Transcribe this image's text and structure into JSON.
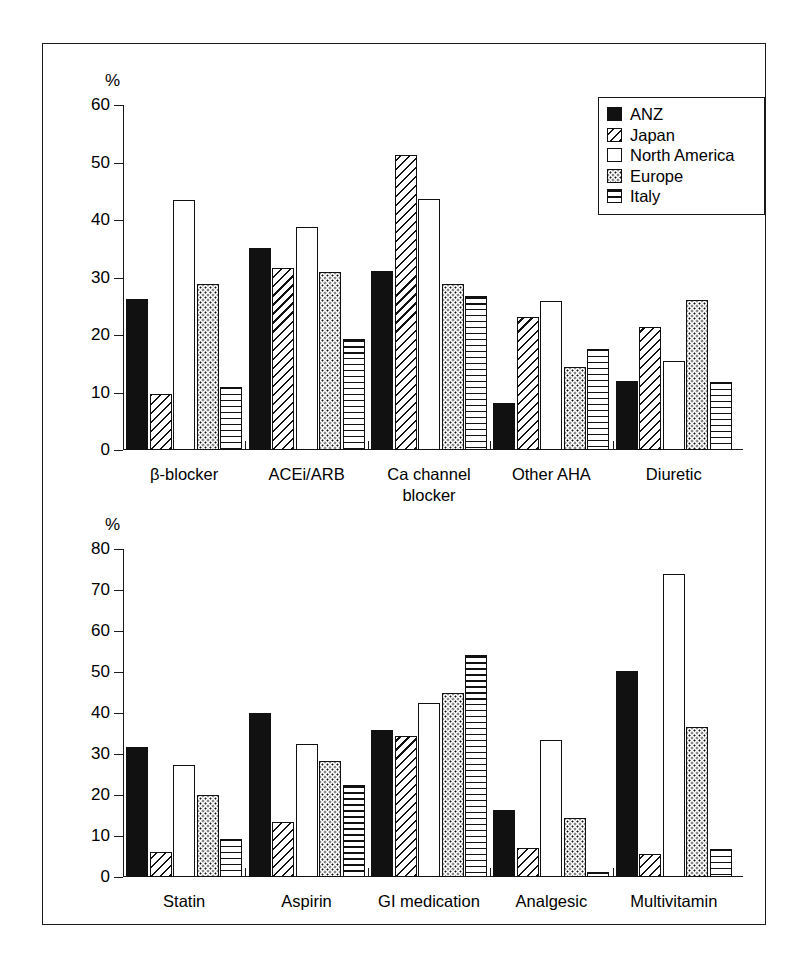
{
  "figure": {
    "axis_unit_label": "%"
  },
  "legend": {
    "position": "top-right",
    "entries": [
      {
        "label": "ANZ",
        "pattern": "solid-black",
        "key": "anz"
      },
      {
        "label": "Japan",
        "pattern": "diagonal-hatch",
        "key": "japan"
      },
      {
        "label": "North America",
        "pattern": "white-empty",
        "key": "northamerica"
      },
      {
        "label": "Europe",
        "pattern": "dotted",
        "key": "europe"
      },
      {
        "label": "Italy",
        "pattern": "horizontal-lines",
        "key": "italy"
      }
    ]
  },
  "chart_data": [
    {
      "id": "top",
      "type": "bar",
      "title": "",
      "xlabel": "",
      "ylabel": "%",
      "ylim": [
        0,
        60
      ],
      "yticks": [
        0,
        10,
        20,
        30,
        40,
        50,
        60
      ],
      "grid": false,
      "legend_position": "upper right",
      "categories": [
        "β-blocker",
        "ACEi/ARB",
        "Ca channel\nblocker",
        "Other AHA",
        "Diuretic"
      ],
      "series": [
        {
          "name": "ANZ",
          "values": [
            26.3,
            35.1,
            31.2,
            8.1,
            12.0
          ]
        },
        {
          "name": "Japan",
          "values": [
            9.7,
            31.7,
            51.3,
            23.2,
            21.4
          ]
        },
        {
          "name": "North America",
          "values": [
            43.5,
            38.8,
            43.6,
            25.9,
            15.5
          ]
        },
        {
          "name": "Europe",
          "values": [
            28.8,
            31.0,
            28.8,
            14.4,
            26.1
          ]
        },
        {
          "name": "Italy",
          "values": [
            11.0,
            19.3,
            26.7,
            17.5,
            11.9
          ]
        }
      ]
    },
    {
      "id": "bottom",
      "type": "bar",
      "title": "",
      "xlabel": "",
      "ylabel": "%",
      "ylim": [
        0,
        80
      ],
      "yticks": [
        0,
        10,
        20,
        30,
        40,
        50,
        60,
        70,
        80
      ],
      "grid": false,
      "legend_position": "none",
      "categories": [
        "Statin",
        "Aspirin",
        "GI medication",
        "Analgesic",
        "Multivitamin"
      ],
      "series": [
        {
          "name": "ANZ",
          "values": [
            31.6,
            40.0,
            35.8,
            16.4,
            50.2
          ]
        },
        {
          "name": "Japan",
          "values": [
            6.1,
            13.3,
            34.4,
            7.0,
            5.7
          ]
        },
        {
          "name": "North America",
          "values": [
            27.3,
            32.5,
            42.5,
            33.3,
            74.0
          ]
        },
        {
          "name": "Europe",
          "values": [
            20.0,
            28.4,
            45.0,
            14.5,
            36.5
          ]
        },
        {
          "name": "Italy",
          "values": [
            9.3,
            22.5,
            54.2,
            1.3,
            6.8
          ]
        }
      ]
    }
  ]
}
